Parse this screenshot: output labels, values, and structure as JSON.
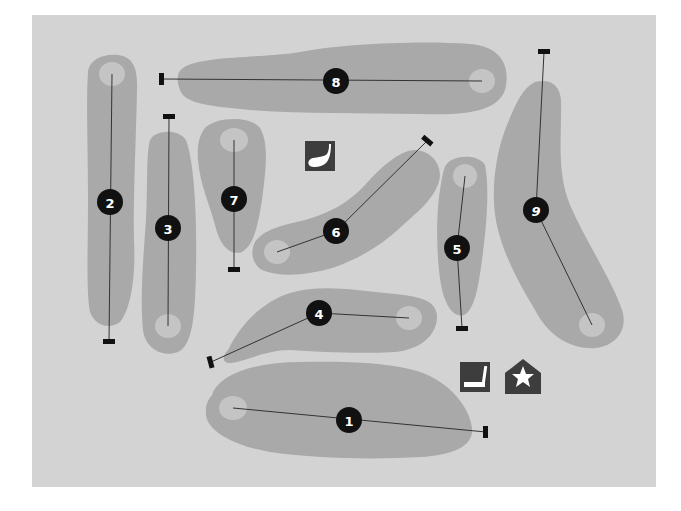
{
  "map": {
    "title": "Golf course layout",
    "background_color": "#d3d3d3",
    "fairway_color": "#a9a9a9",
    "green_color": "#c4c4c4",
    "marker_color": "#111111",
    "panel": {
      "x": 32,
      "y": 15,
      "width": 624,
      "height": 472
    }
  },
  "holes": [
    {
      "number": "1",
      "label_pos": [
        349,
        420
      ],
      "tee": [
        486,
        432
      ],
      "pin": [
        233,
        408
      ]
    },
    {
      "number": "2",
      "label_pos": [
        110,
        202
      ],
      "tee": [
        109,
        342
      ],
      "pin": [
        112,
        74
      ]
    },
    {
      "number": "3",
      "label_pos": [
        168,
        228
      ],
      "tee": [
        169,
        117
      ],
      "pin": [
        168,
        326
      ]
    },
    {
      "number": "4",
      "label_pos": [
        319,
        313
      ],
      "tee": [
        211,
        362
      ],
      "pin": [
        409,
        318
      ]
    },
    {
      "number": "5",
      "label_pos": [
        457,
        248
      ],
      "tee": [
        462,
        328
      ],
      "pin": [
        465,
        176
      ]
    },
    {
      "number": "6",
      "label_pos": [
        336,
        231
      ],
      "tee": [
        427,
        141
      ],
      "pin": [
        277,
        252
      ]
    },
    {
      "number": "7",
      "label_pos": [
        234,
        199
      ],
      "tee": [
        234,
        270
      ],
      "pin": [
        234,
        140
      ]
    },
    {
      "number": "8",
      "label_pos": [
        336,
        81
      ],
      "tee": [
        162,
        79
      ],
      "pin": [
        482,
        81
      ]
    },
    {
      "number": "9",
      "label_pos": [
        536,
        210
      ],
      "tee": [
        544,
        52
      ],
      "pin": [
        592,
        325
      ]
    }
  ],
  "icons": [
    {
      "name": "driving-range-icon",
      "x": 305,
      "y": 141,
      "size": 30
    },
    {
      "name": "putting-green-icon",
      "x": 460,
      "y": 362,
      "size": 30
    },
    {
      "name": "clubhouse-icon",
      "x": 505,
      "y": 359,
      "size": 36
    }
  ]
}
